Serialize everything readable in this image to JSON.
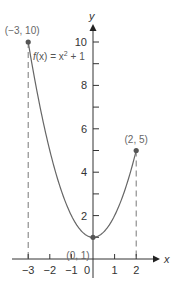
{
  "chart_data": {
    "type": "line",
    "title": "",
    "function_label": "f(x) = x² + 1",
    "function_label_parts": {
      "prefix": "f",
      "arg": "(x) = x",
      "exp": "2",
      "suffix": " + 1"
    },
    "xlabel": "x",
    "ylabel": "y",
    "xlim": [
      -3,
      2
    ],
    "ylim": [
      0,
      10
    ],
    "x_ticks": [
      -3,
      -2,
      -1,
      0,
      1,
      2
    ],
    "x_tick_labels": [
      "−3",
      "−2",
      "−1",
      "0",
      "1",
      "2"
    ],
    "y_ticks": [
      1,
      2,
      3,
      4,
      5,
      6,
      7,
      8,
      9,
      10
    ],
    "y_tick_labels": [
      "2",
      "4",
      "6",
      "8",
      "10"
    ],
    "y_labeled_ticks": [
      2,
      4,
      6,
      8,
      10
    ],
    "grid": false,
    "series": [
      {
        "name": "f(x) = x² + 1",
        "x": [
          -3,
          -2.5,
          -2,
          -1.5,
          -1,
          -0.5,
          0,
          0.5,
          1,
          1.5,
          2
        ],
        "y": [
          10,
          7.25,
          5,
          3.25,
          2,
          1.25,
          1,
          1.25,
          2,
          3.25,
          5
        ]
      }
    ],
    "annotated_points": [
      {
        "x": -3,
        "y": 10,
        "label": "(−3, 10)"
      },
      {
        "x": 0,
        "y": 1,
        "label": "(0, 1)"
      },
      {
        "x": 2,
        "y": 5,
        "label": "(2, 5)"
      }
    ],
    "dashed_guides": [
      -3,
      2
    ],
    "colors": {
      "axis": "#333333",
      "curve": "#666666",
      "point": "#555555",
      "dash": "#777777"
    }
  }
}
